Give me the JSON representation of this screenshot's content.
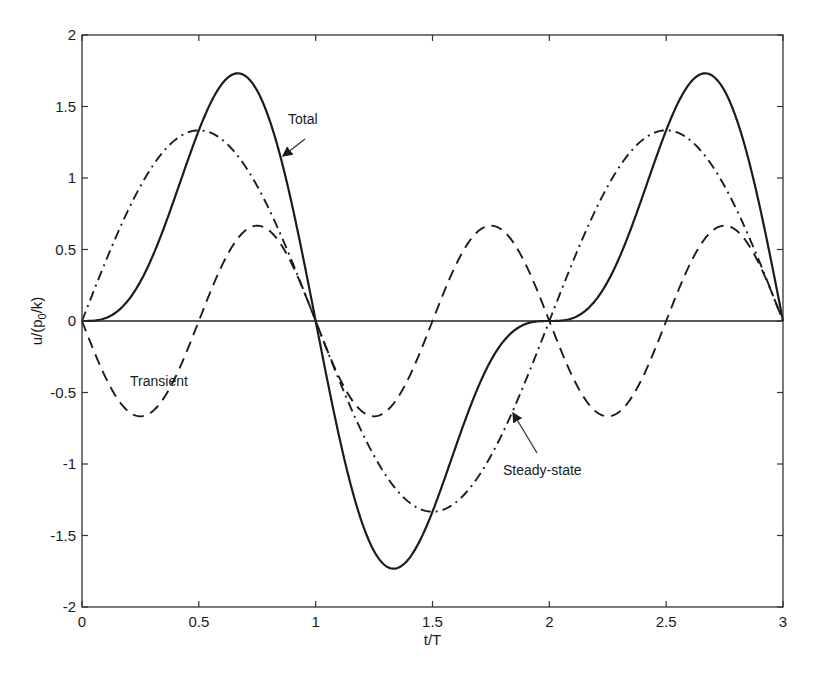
{
  "chart_data": {
    "type": "line",
    "title": "",
    "xlabel": "t/T",
    "ylabel": "u/(p0/k)",
    "ylabel_parts": {
      "main": "u/(p",
      "sub": "0",
      "tail": "/k)"
    },
    "xlim": [
      0,
      3
    ],
    "ylim": [
      -2,
      2
    ],
    "xticks": [
      0,
      0.5,
      1,
      1.5,
      2,
      2.5,
      3
    ],
    "xtick_labels": [
      "0",
      "0.5",
      "1",
      "1.5",
      "2",
      "2.5",
      "3"
    ],
    "yticks": [
      2,
      1.5,
      1,
      0.5,
      0,
      -0.5,
      -1,
      -1.5,
      -2
    ],
    "ytick_labels": [
      "2",
      "1.5",
      "1",
      "0.5",
      "0",
      "-0.5",
      "-1",
      "-1.5",
      "-2"
    ],
    "grid": false,
    "legend": "none (inline annotations)",
    "x": [
      0,
      0.125,
      0.25,
      0.375,
      0.5,
      0.625,
      0.75,
      0.875,
      1,
      1.125,
      1.25,
      1.375,
      1.5,
      1.625,
      1.75,
      1.875,
      2,
      2.125,
      2.25,
      2.375,
      2.5,
      2.625,
      2.75,
      2.875,
      3
    ],
    "series": [
      {
        "name": "Total",
        "style": "solid",
        "values": [
          0,
          0.04,
          0.28,
          0.76,
          1.33,
          1.69,
          1.7,
          1.04,
          0,
          -1.04,
          -1.7,
          -1.69,
          -1.33,
          -0.76,
          -0.28,
          -0.04,
          0,
          0.04,
          0.28,
          0.76,
          1.33,
          1.69,
          1.7,
          1.04,
          0
        ]
      },
      {
        "name": "Steady-state",
        "style": "dash-dot",
        "values": [
          0,
          0.51,
          0.94,
          1.23,
          1.33,
          1.23,
          0.94,
          0.51,
          0,
          -0.51,
          -0.94,
          -1.23,
          -1.33,
          -1.23,
          -0.94,
          -0.51,
          0,
          0.51,
          0.94,
          1.23,
          1.33,
          1.23,
          0.94,
          0.51,
          0
        ]
      },
      {
        "name": "Transient",
        "style": "dashed",
        "values": [
          0,
          -0.47,
          -0.67,
          -0.47,
          0,
          0.47,
          0.67,
          0.47,
          0,
          -0.47,
          -0.67,
          -0.47,
          0,
          0.47,
          0.67,
          0.47,
          0,
          -0.47,
          -0.67,
          -0.47,
          0,
          0.47,
          0.67,
          0.47,
          0
        ]
      }
    ],
    "formulas": {
      "Steady-state": "(4/3) sin(pi t/T)",
      "Transient": "-(2/3) sin(2 pi t/T)",
      "Total": "Steady-state + Transient"
    },
    "annotations": [
      {
        "text": "Total",
        "label_at": [
          1.06,
          1.41
        ],
        "arrow_to": [
          0.85,
          1.14
        ]
      },
      {
        "text": "Transient",
        "label_at": [
          0.4,
          -0.42
        ]
      },
      {
        "text": "Steady-state",
        "label_at": [
          1.81,
          -1.19
        ],
        "arrow_to": [
          1.84,
          -0.65
        ]
      }
    ],
    "zero_line": true
  }
}
